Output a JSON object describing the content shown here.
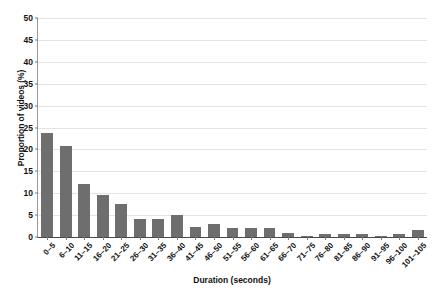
{
  "chart_data": {
    "type": "bar",
    "title": "",
    "xlabel": "Duration (seconds)",
    "ylabel": "Proportion of videos (%)",
    "categories": [
      "0–5",
      "6–10",
      "11–15",
      "16–20",
      "21–25",
      "26–30",
      "31–35",
      "36–40",
      "41–45",
      "46–50",
      "51–55",
      "56–60",
      "61–65",
      "66–70",
      "71–75",
      "76–80",
      "81–85",
      "86–90",
      "91–95",
      "96–100",
      "101–105"
    ],
    "values": [
      23.8,
      20.7,
      12.0,
      9.5,
      7.5,
      4.0,
      4.2,
      5.0,
      2.3,
      3.0,
      2.0,
      2.0,
      2.0,
      1.0,
      0.3,
      0.6,
      0.6,
      0.6,
      0.3,
      0.6,
      1.5
    ],
    "ylim": [
      0,
      50
    ],
    "ytick_labels": [
      "0",
      "5",
      "10",
      "15",
      "20",
      "25",
      "30",
      "35",
      "40",
      "45",
      "50"
    ],
    "ytick_values": [
      0,
      5,
      10,
      15,
      20,
      25,
      30,
      35,
      40,
      45,
      50
    ],
    "grid": "horizontal",
    "legend": "none",
    "bar_color": "#6e6e6e",
    "grid_color": "#e3e3e3",
    "axis_color": "#4a4a4a"
  },
  "figure": {
    "caption_fragment": ""
  }
}
